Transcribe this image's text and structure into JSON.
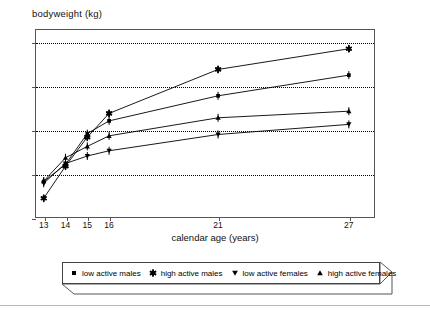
{
  "chart_data": {
    "type": "line",
    "title": "bodyweight (kg)",
    "xlabel": "calendar age (years)",
    "ylabel": "bodyweight (kg)",
    "xlim": [
      12.6,
      28.2
    ],
    "ylim": [
      40,
      83
    ],
    "xticks": [
      13,
      14,
      15,
      16,
      21,
      27
    ],
    "xtick_labels": [
      "13",
      "14",
      "15",
      "16",
      "21",
      "27"
    ],
    "yticks": [
      40,
      50,
      60,
      70,
      80
    ],
    "ytick_labels": [
      "40",
      "50",
      "60",
      "70",
      "80"
    ],
    "grid": "horizontal-dotted",
    "legend_position": "below-plot",
    "x": [
      13,
      14,
      15,
      16,
      21,
      27
    ],
    "series": [
      {
        "name": "low active males",
        "marker": "square",
        "values": [
          48.3,
          52.2,
          59.2,
          62.1,
          67.8,
          72.5
        ]
      },
      {
        "name": "high active males",
        "marker": "star",
        "values": [
          44.5,
          51.8,
          58.4,
          63.8,
          73.8,
          78.5
        ]
      },
      {
        "name": "low active females",
        "marker": "triangle-down",
        "values": [
          47.9,
          52.4,
          54.1,
          55.3,
          59.0,
          61.3
        ]
      },
      {
        "name": "high active females",
        "marker": "triangle-up",
        "values": [
          48.4,
          53.7,
          56.3,
          58.7,
          62.8,
          64.3
        ]
      }
    ]
  },
  "legend": {
    "items": [
      {
        "label": "low active males",
        "marker": "square"
      },
      {
        "label": "high active males",
        "marker": "star"
      },
      {
        "label": "low active females",
        "marker": "triangle-down"
      },
      {
        "label": "high active females",
        "marker": "triangle-up"
      }
    ]
  },
  "colors": {
    "ink": "#000000",
    "axis": "#555555",
    "grid": "#000000",
    "background": "#ffffff"
  }
}
